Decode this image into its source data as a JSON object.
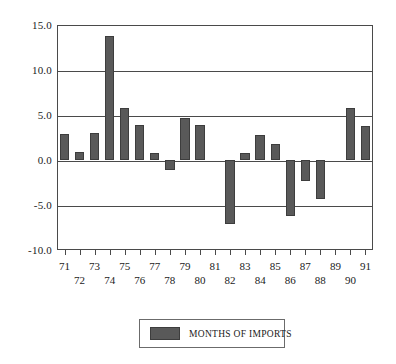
{
  "chart_data": {
    "type": "bar",
    "title": "",
    "xlabel": "",
    "ylabel": "",
    "ylim": [
      -10.0,
      15.0
    ],
    "grid": true,
    "legend_position": "bottom-center",
    "categories": [
      "71",
      "72",
      "73",
      "74",
      "75",
      "76",
      "77",
      "78",
      "79",
      "80",
      "81",
      "82",
      "83",
      "84",
      "85",
      "86",
      "87",
      "88",
      "89",
      "90",
      "91"
    ],
    "series": [
      {
        "name": "MONTHS OF IMPORTS",
        "color": "#595959",
        "values": [
          2.9,
          0.9,
          3.0,
          13.8,
          5.8,
          3.9,
          0.8,
          -1.1,
          4.7,
          3.9,
          0.0,
          -7.1,
          0.8,
          2.8,
          1.8,
          -6.2,
          -2.3,
          -4.3,
          0.0,
          5.8,
          3.8
        ]
      }
    ],
    "ytick_values": [
      15.0,
      10.0,
      5.0,
      0.0,
      -5.0,
      -10.0
    ],
    "ytick_labels": [
      "15.0",
      "10.0",
      "5.0",
      "0.0",
      "-5.0",
      "-10.0"
    ]
  },
  "legend": {
    "label": "MONTHS OF IMPORTS"
  },
  "colors": {
    "bar": "#595959",
    "bar_edge": "#3d3d3d",
    "axis": "#4a4a4a",
    "background": "#ffffff"
  }
}
